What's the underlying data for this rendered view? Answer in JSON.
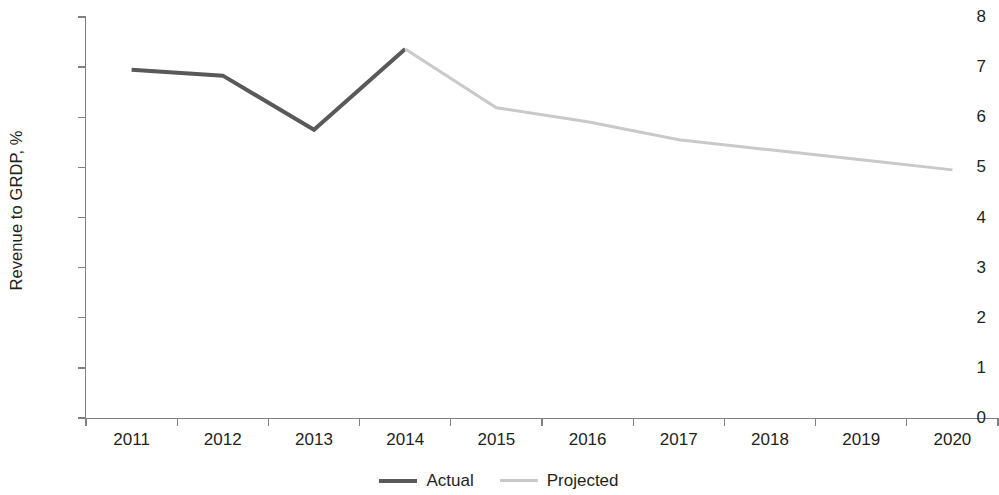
{
  "chart_data": {
    "type": "line",
    "title": "",
    "xlabel": "",
    "ylabel": "Revenue to GRDP, %",
    "x": [
      "2011",
      "2012",
      "2013",
      "2014",
      "2015",
      "2016",
      "2017",
      "2018",
      "2019",
      "2020"
    ],
    "xlim": [
      2011,
      2020
    ],
    "ylim": [
      0,
      8
    ],
    "y_ticks": [
      "8",
      "7",
      "6",
      "5",
      "4",
      "3",
      "2",
      "1",
      "0"
    ],
    "y_tick_values": [
      8,
      7,
      6,
      5,
      4,
      3,
      2,
      1,
      0
    ],
    "grid": false,
    "legend_position": "bottom-center",
    "series": [
      {
        "name": "Actual",
        "color": "#595959",
        "x": [
          "2011",
          "2012",
          "2013",
          "2014"
        ],
        "values": [
          6.95,
          6.83,
          5.75,
          7.36
        ]
      },
      {
        "name": "Projected",
        "color": "#c9c9c9",
        "x": [
          "2014",
          "2015",
          "2016",
          "2017",
          "2018",
          "2019",
          "2020"
        ],
        "values": [
          7.36,
          6.19,
          5.91,
          5.55,
          5.35,
          5.15,
          4.95
        ]
      }
    ]
  },
  "axes": {
    "y_title": "Revenue to GRDP, %",
    "y_labels": [
      "8",
      "7",
      "6",
      "5",
      "4",
      "3",
      "2",
      "1",
      "0"
    ],
    "x_labels": [
      "2011",
      "2012",
      "2013",
      "2014",
      "2015",
      "2016",
      "2017",
      "2018",
      "2019",
      "2020"
    ],
    "axis_color": "#808080"
  },
  "legend": {
    "items": [
      {
        "label": "Actual",
        "color": "#595959"
      },
      {
        "label": "Projected",
        "color": "#c9c9c9"
      }
    ]
  }
}
